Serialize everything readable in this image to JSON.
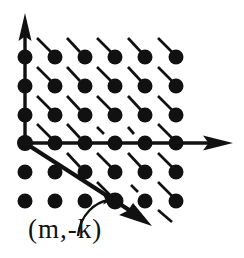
{
  "figure": {
    "colors": {
      "ink": "#111111",
      "background": "#ffffff"
    },
    "axes": {
      "origin": {
        "x": 25,
        "y": 143
      },
      "x_axis": {
        "label": "",
        "from_x": 25,
        "to_x": 232,
        "y": 143,
        "arrow": "right-arrow"
      },
      "y_axis": {
        "label": "",
        "x": 25,
        "from_y": 143,
        "to_y": 16,
        "arrow": "up-arrow"
      }
    },
    "lattice": {
      "columns_x": [
        25,
        55,
        85,
        115,
        145,
        176
      ],
      "rows_y": [
        57,
        86,
        115,
        143,
        172,
        201
      ],
      "dot_radius": 7.5,
      "dot_count": 36
    },
    "dashes": [
      {
        "x1": 37,
        "y1": 38,
        "x2": 51,
        "y2": 52
      },
      {
        "x1": 67,
        "y1": 38,
        "x2": 80,
        "y2": 52
      },
      {
        "x1": 97,
        "y1": 38,
        "x2": 111,
        "y2": 52
      },
      {
        "x1": 128,
        "y1": 38,
        "x2": 141,
        "y2": 52
      },
      {
        "x1": 158,
        "y1": 38,
        "x2": 172,
        "y2": 52
      },
      {
        "x1": 37,
        "y1": 67,
        "x2": 51,
        "y2": 81
      },
      {
        "x1": 67,
        "y1": 67,
        "x2": 80,
        "y2": 81
      },
      {
        "x1": 97,
        "y1": 67,
        "x2": 111,
        "y2": 81
      },
      {
        "x1": 128,
        "y1": 67,
        "x2": 141,
        "y2": 81
      },
      {
        "x1": 158,
        "y1": 67,
        "x2": 172,
        "y2": 81
      },
      {
        "x1": 37,
        "y1": 96,
        "x2": 51,
        "y2": 110
      },
      {
        "x1": 67,
        "y1": 96,
        "x2": 80,
        "y2": 110
      },
      {
        "x1": 97,
        "y1": 96,
        "x2": 111,
        "y2": 110
      },
      {
        "x1": 128,
        "y1": 96,
        "x2": 141,
        "y2": 110
      },
      {
        "x1": 158,
        "y1": 96,
        "x2": 172,
        "y2": 110
      },
      {
        "x1": 37,
        "y1": 124,
        "x2": 51,
        "y2": 138
      },
      {
        "x1": 67,
        "y1": 124,
        "x2": 80,
        "y2": 138
      },
      {
        "x1": 97,
        "y1": 127,
        "x2": 104,
        "y2": 134
      },
      {
        "x1": 128,
        "y1": 127,
        "x2": 134,
        "y2": 134
      },
      {
        "x1": 158,
        "y1": 124,
        "x2": 172,
        "y2": 138
      },
      {
        "x1": 67,
        "y1": 153,
        "x2": 80,
        "y2": 167
      },
      {
        "x1": 97,
        "y1": 153,
        "x2": 111,
        "y2": 167
      },
      {
        "x1": 128,
        "y1": 153,
        "x2": 141,
        "y2": 167
      },
      {
        "x1": 158,
        "y1": 153,
        "x2": 172,
        "y2": 167
      },
      {
        "x1": 97,
        "y1": 182,
        "x2": 111,
        "y2": 196
      },
      {
        "x1": 131,
        "y1": 185,
        "x2": 138,
        "y2": 192
      },
      {
        "x1": 158,
        "y1": 182,
        "x2": 172,
        "y2": 196
      },
      {
        "x1": 128,
        "y1": 182,
        "x2": 141,
        "y2": 196
      },
      {
        "x1": 158,
        "y1": 210,
        "x2": 172,
        "y2": 222
      }
    ],
    "vector": {
      "from": {
        "x": 25,
        "y": 143
      },
      "through_lattice_point": {
        "x": 115,
        "y": 201
      },
      "arrow_tip": {
        "x": 150,
        "y": 224
      },
      "arrow": "diagonal-arrow"
    },
    "annotation": {
      "label": "(m,-k)",
      "leader": "curved-leader-arc",
      "points_to": {
        "x": 115,
        "y": 201
      }
    }
  }
}
